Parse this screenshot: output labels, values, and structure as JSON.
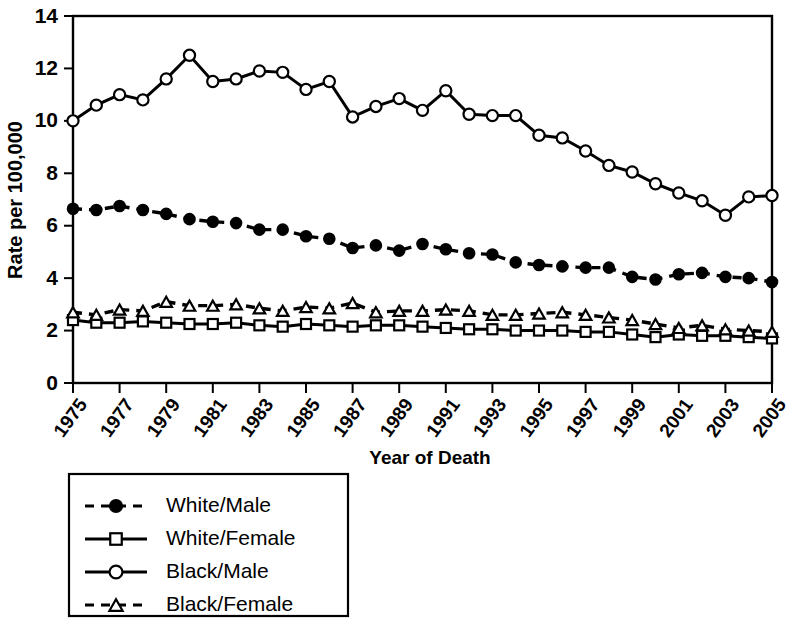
{
  "chart_data": {
    "type": "line",
    "title": "",
    "xlabel": "Year of Death",
    "ylabel": "Rate per 100,000",
    "xlim": [
      1975,
      2005
    ],
    "ylim": [
      0,
      14
    ],
    "yticks": [
      0,
      2,
      4,
      6,
      8,
      10,
      12,
      14
    ],
    "ytick_labels": [
      "0",
      "2",
      "4",
      "6",
      "8",
      "10",
      "12",
      "14"
    ],
    "xticks": [
      1975,
      1977,
      1979,
      1981,
      1983,
      1985,
      1987,
      1989,
      1991,
      1993,
      1995,
      1997,
      1999,
      2001,
      2003,
      2005
    ],
    "xtick_labels": [
      "1975",
      "1977",
      "1979",
      "1981",
      "1983",
      "1985",
      "1987",
      "1989",
      "1991",
      "1993",
      "1995",
      "1997",
      "1999",
      "2001",
      "2003",
      "2005"
    ],
    "grid": false,
    "legend_position": "below-left",
    "x": [
      1975,
      1976,
      1977,
      1978,
      1979,
      1980,
      1981,
      1982,
      1983,
      1984,
      1985,
      1986,
      1987,
      1988,
      1989,
      1990,
      1991,
      1992,
      1993,
      1994,
      1995,
      1996,
      1997,
      1998,
      1999,
      2000,
      2001,
      2002,
      2003,
      2004,
      2005
    ],
    "series": [
      {
        "name": "White/Male",
        "marker": "filled-circle",
        "linestyle": "dashed",
        "color": "#000000",
        "values": [
          6.65,
          6.6,
          6.75,
          6.6,
          6.45,
          6.25,
          6.15,
          6.1,
          5.85,
          5.85,
          5.6,
          5.5,
          5.15,
          5.25,
          5.05,
          5.3,
          5.1,
          4.95,
          4.9,
          4.6,
          4.5,
          4.45,
          4.4,
          4.4,
          4.05,
          3.95,
          4.15,
          4.2,
          4.05,
          4.0,
          3.85
        ]
      },
      {
        "name": "White/Female",
        "marker": "open-square",
        "linestyle": "solid",
        "color": "#000000",
        "values": [
          2.4,
          2.3,
          2.3,
          2.35,
          2.3,
          2.25,
          2.25,
          2.3,
          2.2,
          2.15,
          2.25,
          2.2,
          2.15,
          2.2,
          2.2,
          2.15,
          2.1,
          2.05,
          2.05,
          2.0,
          2.0,
          2.0,
          1.95,
          1.95,
          1.85,
          1.75,
          1.85,
          1.8,
          1.8,
          1.75,
          1.7
        ]
      },
      {
        "name": "Black/Male",
        "marker": "open-circle",
        "linestyle": "solid",
        "color": "#000000",
        "values": [
          10.0,
          10.6,
          11.0,
          10.8,
          11.6,
          12.5,
          11.5,
          11.6,
          11.9,
          11.85,
          11.2,
          11.5,
          10.15,
          10.55,
          10.85,
          10.4,
          11.15,
          10.25,
          10.2,
          10.2,
          9.45,
          9.35,
          8.85,
          8.3,
          8.05,
          7.6,
          7.25,
          6.95,
          6.4,
          7.1,
          7.15
        ]
      },
      {
        "name": "Black/Female",
        "marker": "open-triangle",
        "linestyle": "dashed",
        "color": "#000000",
        "values": [
          2.7,
          2.6,
          2.8,
          2.75,
          3.1,
          2.95,
          2.95,
          3.0,
          2.85,
          2.75,
          2.9,
          2.85,
          3.05,
          2.7,
          2.75,
          2.75,
          2.8,
          2.75,
          2.6,
          2.6,
          2.65,
          2.7,
          2.6,
          2.5,
          2.4,
          2.25,
          2.1,
          2.2,
          2.05,
          2.0,
          1.95
        ]
      }
    ]
  },
  "chart": {
    "ylabel": "Rate per 100,000",
    "xlabel": "Year of Death"
  },
  "legend": {
    "items": [
      {
        "label": "White/Male",
        "marker": "filled-circle",
        "linestyle": "dashed"
      },
      {
        "label": "White/Female",
        "marker": "open-square",
        "linestyle": "solid"
      },
      {
        "label": "Black/Male",
        "marker": "open-circle",
        "linestyle": "solid"
      },
      {
        "label": "Black/Female",
        "marker": "open-triangle",
        "linestyle": "dashed"
      }
    ]
  }
}
